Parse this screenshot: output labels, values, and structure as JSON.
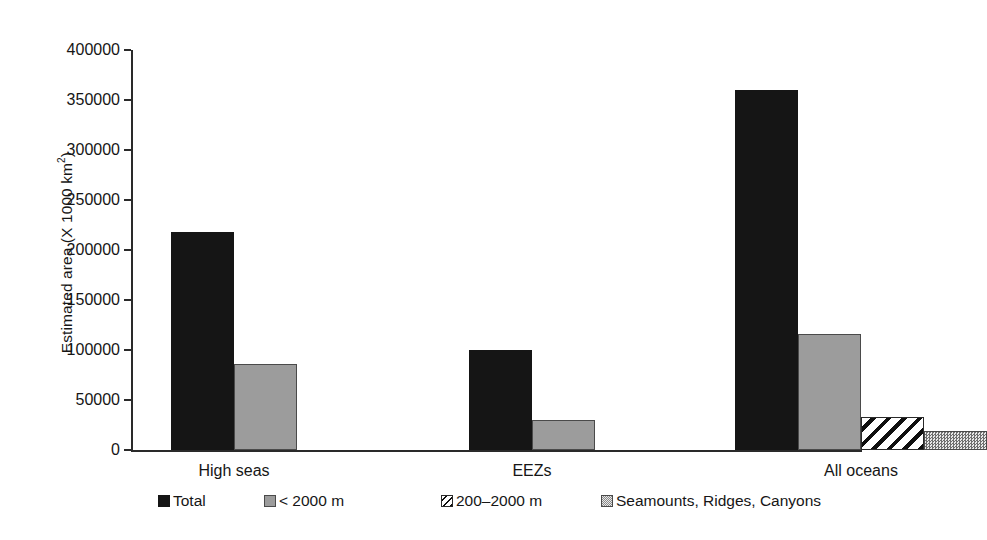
{
  "chart_data": {
    "type": "bar",
    "title": "",
    "xlabel": "",
    "ylabel": "Estimated area (X 1000 km²)",
    "ylabel_main": "Estimated area (X 1000 km",
    "ylabel_sup": "2",
    "ylabel_tail": ")",
    "categories": [
      "High seas",
      "EEZs",
      "All oceans"
    ],
    "ylim": [
      0,
      400000
    ],
    "yticks": [
      0,
      50000,
      100000,
      150000,
      200000,
      250000,
      300000,
      350000,
      400000
    ],
    "ytick_labels": [
      "0",
      "50000",
      "100000",
      "150000",
      "200000",
      "250000",
      "300000",
      "350000",
      "400000"
    ],
    "grid": false,
    "legend_position": "bottom",
    "series": [
      {
        "name": "Total",
        "key": "total",
        "color": "#151515",
        "pattern": "solid-black",
        "values": [
          218000,
          100000,
          360000
        ]
      },
      {
        "name": "< 2000 m",
        "key": "lt2000",
        "color": "#9c9c9c",
        "pattern": "solid-gray",
        "values": [
          86000,
          30000,
          116000
        ]
      },
      {
        "name": "200–2000 m",
        "key": "mid",
        "color": "#0f0f0f",
        "pattern": "diagonal-hatch",
        "values": [
          null,
          null,
          33000
        ]
      },
      {
        "name": "Seamounts, Ridges, Canyons",
        "key": "smt",
        "color": "#8a8a8a",
        "pattern": "fine-dotted",
        "values": [
          null,
          null,
          19000
        ]
      }
    ]
  },
  "axis": {
    "ylabel_text": "Estimated area (X 1000 km",
    "ylabel_superscript": "2",
    "ylabel_close": ")"
  },
  "legend": {
    "items": [
      {
        "label": "Total",
        "swatch": "solid-black-swatch"
      },
      {
        "label": "< 2000 m",
        "swatch": "solid-gray-swatch"
      },
      {
        "label": "200–2000 m",
        "swatch": "diagonal-hatch-swatch"
      },
      {
        "label": "Seamounts, Ridges, Canyons",
        "swatch": "fine-dotted-swatch"
      }
    ]
  }
}
